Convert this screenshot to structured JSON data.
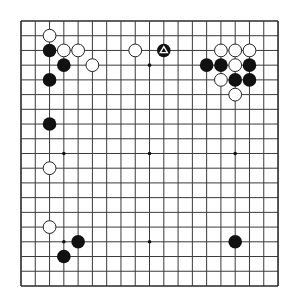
{
  "board": {
    "size": 19,
    "origin_x": 21,
    "origin_y": 21,
    "spacing_x": 14.28,
    "spacing_y": 14.72,
    "line_color": "#3a3a3a",
    "border_color": "#2a2a2a",
    "background": "#ffffff",
    "stone_radius": 6.8,
    "black_color": "#111111",
    "white_fill": "#ffffff",
    "white_stroke": "#222222"
  },
  "star_points": [
    [
      3,
      3
    ],
    [
      9,
      3
    ],
    [
      15,
      3
    ],
    [
      3,
      9
    ],
    [
      9,
      9
    ],
    [
      15,
      9
    ],
    [
      3,
      15
    ],
    [
      9,
      15
    ],
    [
      15,
      15
    ]
  ],
  "stones": [
    {
      "color": "white",
      "col": 2,
      "row": 1
    },
    {
      "color": "black",
      "col": 2,
      "row": 2
    },
    {
      "color": "white",
      "col": 3,
      "row": 2
    },
    {
      "color": "white",
      "col": 4,
      "row": 2
    },
    {
      "color": "black",
      "col": 3,
      "row": 3
    },
    {
      "color": "white",
      "col": 5,
      "row": 3
    },
    {
      "color": "black",
      "col": 2,
      "row": 4
    },
    {
      "color": "white",
      "col": 8,
      "row": 2
    },
    {
      "color": "black",
      "col": 10,
      "row": 2,
      "marker": "triangle"
    },
    {
      "color": "white",
      "col": 14,
      "row": 2
    },
    {
      "color": "white",
      "col": 15,
      "row": 2
    },
    {
      "color": "white",
      "col": 16,
      "row": 2
    },
    {
      "color": "black",
      "col": 13,
      "row": 3
    },
    {
      "color": "black",
      "col": 14,
      "row": 3
    },
    {
      "color": "white",
      "col": 15,
      "row": 3
    },
    {
      "color": "black",
      "col": 16,
      "row": 3
    },
    {
      "color": "white",
      "col": 14,
      "row": 4
    },
    {
      "color": "black",
      "col": 15,
      "row": 4
    },
    {
      "color": "black",
      "col": 16,
      "row": 4
    },
    {
      "color": "white",
      "col": 15,
      "row": 5
    },
    {
      "color": "black",
      "col": 2,
      "row": 7
    },
    {
      "color": "white",
      "col": 2,
      "row": 10
    },
    {
      "color": "white",
      "col": 2,
      "row": 14
    },
    {
      "color": "black",
      "col": 4,
      "row": 15
    },
    {
      "color": "black",
      "col": 3,
      "row": 16
    },
    {
      "color": "black",
      "col": 15,
      "row": 15
    }
  ],
  "last_move_marker": {
    "shape": "triangle",
    "col": 10,
    "row": 2,
    "color": "#ffffff"
  }
}
